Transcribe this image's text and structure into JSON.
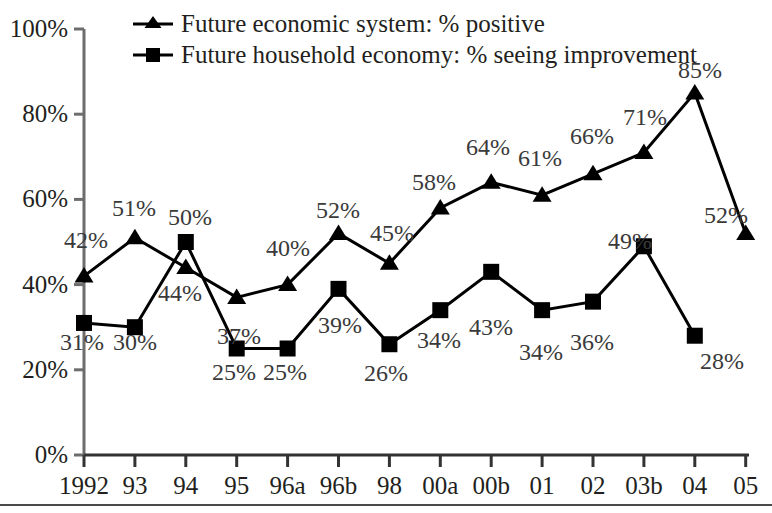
{
  "chart_data": {
    "type": "line",
    "title": "",
    "xlabel": "",
    "ylabel": "",
    "ylim": [
      0,
      100
    ],
    "grid": false,
    "legend_position": "top-center",
    "ytick_labels": [
      "100%",
      "80%",
      "60%",
      "40%",
      "20%",
      "0%"
    ],
    "ytick_values": [
      100,
      80,
      60,
      40,
      20,
      0
    ],
    "categories": [
      "1992",
      "93",
      "94",
      "95",
      "96a",
      "96b",
      "98",
      "00a",
      "00b",
      "01",
      "02",
      "03b",
      "04",
      "05"
    ],
    "series": [
      {
        "name": "Future economic system: % positive",
        "marker": "triangle",
        "color": "#000000",
        "values": [
          42,
          51,
          44,
          37,
          40,
          52,
          45,
          58,
          64,
          61,
          66,
          71,
          85,
          52
        ],
        "point_labels": [
          "42%",
          "51%",
          "44%",
          "37%",
          "40%",
          "52%",
          "45%",
          "58%",
          "64%",
          "61%",
          "66%",
          "71%",
          "85%",
          "52%"
        ]
      },
      {
        "name": "Future household economy: % seeing improvement",
        "marker": "square",
        "color": "#000000",
        "values": [
          31,
          30,
          50,
          25,
          25,
          39,
          26,
          34,
          43,
          34,
          36,
          49,
          28,
          null
        ],
        "point_labels": [
          "31%",
          "30%",
          "50%",
          "25%",
          "25%",
          "39%",
          "26%",
          "34%",
          "43%",
          "34%",
          "36%",
          "49%",
          "28%",
          ""
        ]
      }
    ]
  },
  "legend": {
    "items": [
      {
        "label": "Future economic system: % positive",
        "marker": "triangle"
      },
      {
        "label": "Future household economy: % seeing improvement",
        "marker": "square"
      }
    ]
  },
  "axis": {
    "y_ticks": [
      {
        "label": "100%"
      },
      {
        "label": "80%"
      },
      {
        "label": "60%"
      },
      {
        "label": "40%"
      },
      {
        "label": "20%"
      },
      {
        "label": "0%"
      }
    ],
    "x_ticks": [
      {
        "label": "1992"
      },
      {
        "label": "93"
      },
      {
        "label": "94"
      },
      {
        "label": "95"
      },
      {
        "label": "96a"
      },
      {
        "label": "96b"
      },
      {
        "label": "98"
      },
      {
        "label": "00a"
      },
      {
        "label": "00b"
      },
      {
        "label": "01"
      },
      {
        "label": "02"
      },
      {
        "label": "03b"
      },
      {
        "label": "04"
      },
      {
        "label": "05"
      }
    ]
  },
  "data_labels": {
    "economic": [
      {
        "text": "42%",
        "x": 64,
        "y": 228
      },
      {
        "text": "51%",
        "x": 112,
        "y": 196
      },
      {
        "text": "50%",
        "x": 168,
        "y": 205
      },
      {
        "text": "44%",
        "x": 158,
        "y": 281
      },
      {
        "text": "37%",
        "x": 217,
        "y": 324
      },
      {
        "text": "40%",
        "x": 266,
        "y": 236
      },
      {
        "text": "52%",
        "x": 316,
        "y": 198
      },
      {
        "text": "45%",
        "x": 370,
        "y": 221
      },
      {
        "text": "58%",
        "x": 412,
        "y": 170
      },
      {
        "text": "64%",
        "x": 466,
        "y": 135
      },
      {
        "text": "61%",
        "x": 518,
        "y": 146
      },
      {
        "text": "66%",
        "x": 570,
        "y": 124
      },
      {
        "text": "71%",
        "x": 623,
        "y": 105
      },
      {
        "text": "85%",
        "x": 678,
        "y": 58
      },
      {
        "text": "52%",
        "x": 704,
        "y": 203
      }
    ],
    "household": [
      {
        "text": "31%",
        "x": 60,
        "y": 330
      },
      {
        "text": "30%",
        "x": 113,
        "y": 330
      },
      {
        "text": "25%",
        "x": 212,
        "y": 360
      },
      {
        "text": "25%",
        "x": 263,
        "y": 360
      },
      {
        "text": "39%",
        "x": 318,
        "y": 313
      },
      {
        "text": "26%",
        "x": 364,
        "y": 361
      },
      {
        "text": "34%",
        "x": 417,
        "y": 328
      },
      {
        "text": "43%",
        "x": 469,
        "y": 315
      },
      {
        "text": "34%",
        "x": 519,
        "y": 340
      },
      {
        "text": "36%",
        "x": 570,
        "y": 330
      },
      {
        "text": "49%",
        "x": 608,
        "y": 229
      },
      {
        "text": "28%",
        "x": 700,
        "y": 349
      }
    ]
  }
}
